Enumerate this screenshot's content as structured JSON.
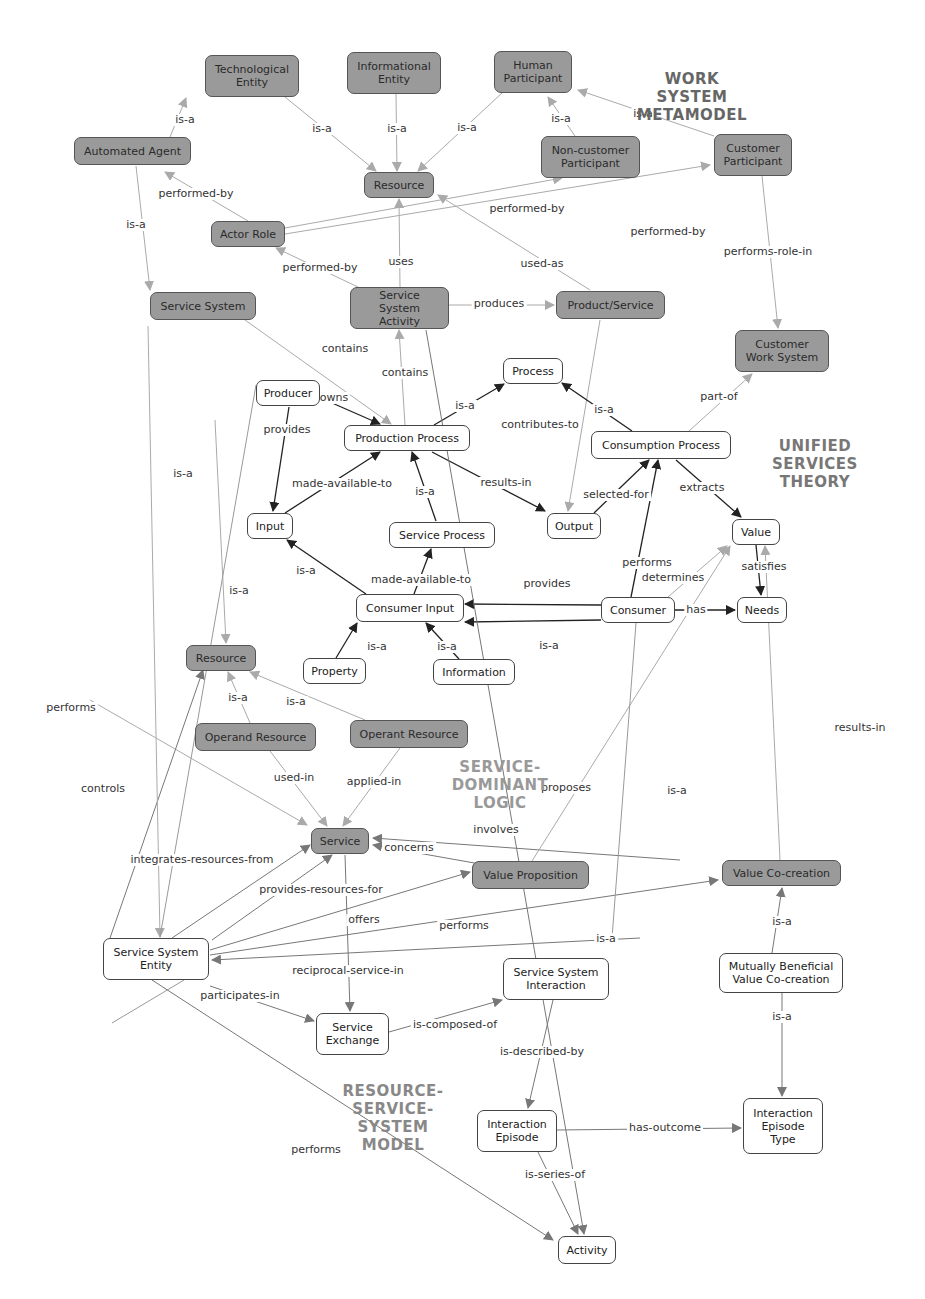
{
  "sections": [
    {
      "id": "wsm",
      "text": "WORK\nSYSTEM\nMETAMODEL",
      "x": 627,
      "y": 70,
      "w": 130,
      "color": "#666666"
    },
    {
      "id": "ust",
      "text": "UNIFIED\nSERVICES\nTHEORY",
      "x": 755,
      "y": 437,
      "w": 120,
      "color": "#777777"
    },
    {
      "id": "sdl",
      "text": "SERVICE-\nDOMINANT\nLOGIC",
      "x": 440,
      "y": 758,
      "w": 120,
      "color": "#999999"
    },
    {
      "id": "rssm",
      "text": "RESOURCE-\nSERVICE-\nSYSTEM\nMODEL",
      "x": 338,
      "y": 1082,
      "w": 110,
      "color": "#888888"
    }
  ],
  "nodes": [
    {
      "id": "tech",
      "label": "Technological\nEntity",
      "x": 205,
      "y": 55,
      "w": 94,
      "h": 42,
      "style": "dark"
    },
    {
      "id": "info_ent",
      "label": "Informational\nEntity",
      "x": 347,
      "y": 52,
      "w": 94,
      "h": 42,
      "style": "dark"
    },
    {
      "id": "human",
      "label": "Human\nParticipant",
      "x": 494,
      "y": 51,
      "w": 78,
      "h": 42,
      "style": "dark"
    },
    {
      "id": "auto",
      "label": "Automated Agent",
      "x": 74,
      "y": 137,
      "w": 117,
      "h": 28,
      "style": "dark"
    },
    {
      "id": "noncust",
      "label": "Non-customer\nParticipant",
      "x": 541,
      "y": 136,
      "w": 99,
      "h": 42,
      "style": "dark"
    },
    {
      "id": "custpart",
      "label": "Customer\nParticipant",
      "x": 714,
      "y": 134,
      "w": 78,
      "h": 42,
      "style": "dark"
    },
    {
      "id": "res_top",
      "label": "Resource",
      "x": 364,
      "y": 172,
      "w": 70,
      "h": 26,
      "style": "dark"
    },
    {
      "id": "actor",
      "label": "Actor Role",
      "x": 211,
      "y": 221,
      "w": 74,
      "h": 26,
      "style": "dark"
    },
    {
      "id": "svcsys",
      "label": "Service System",
      "x": 150,
      "y": 292,
      "w": 106,
      "h": 28,
      "style": "dark"
    },
    {
      "id": "ssa",
      "label": "Service System\nActivity",
      "x": 350,
      "y": 287,
      "w": 99,
      "h": 42,
      "style": "dark"
    },
    {
      "id": "prodsvc",
      "label": "Product/Service",
      "x": 556,
      "y": 291,
      "w": 109,
      "h": 28,
      "style": "dark"
    },
    {
      "id": "custws",
      "label": "Customer\nWork System",
      "x": 735,
      "y": 330,
      "w": 94,
      "h": 42,
      "style": "dark"
    },
    {
      "id": "process",
      "label": "Process",
      "x": 503,
      "y": 358,
      "w": 60,
      "h": 26,
      "style": "light"
    },
    {
      "id": "producer",
      "label": "Producer",
      "x": 256,
      "y": 380,
      "w": 64,
      "h": 26,
      "style": "light"
    },
    {
      "id": "prodproc",
      "label": "Production Process",
      "x": 344,
      "y": 425,
      "w": 126,
      "h": 26,
      "style": "light"
    },
    {
      "id": "consproc",
      "label": "Consumption Process",
      "x": 591,
      "y": 431,
      "w": 140,
      "h": 28,
      "style": "light"
    },
    {
      "id": "input",
      "label": "Input",
      "x": 247,
      "y": 513,
      "w": 46,
      "h": 26,
      "style": "light"
    },
    {
      "id": "svcproc",
      "label": "Service Process",
      "x": 389,
      "y": 522,
      "w": 106,
      "h": 26,
      "style": "light"
    },
    {
      "id": "output",
      "label": "Output",
      "x": 547,
      "y": 513,
      "w": 54,
      "h": 26,
      "style": "light"
    },
    {
      "id": "value",
      "label": "Value",
      "x": 732,
      "y": 519,
      "w": 48,
      "h": 26,
      "style": "light"
    },
    {
      "id": "consinput",
      "label": "Consumer Input",
      "x": 356,
      "y": 594,
      "w": 108,
      "h": 28,
      "style": "light"
    },
    {
      "id": "consumer",
      "label": "Consumer",
      "x": 601,
      "y": 597,
      "w": 74,
      "h": 26,
      "style": "light"
    },
    {
      "id": "needs",
      "label": "Needs",
      "x": 737,
      "y": 597,
      "w": 50,
      "h": 26,
      "style": "light"
    },
    {
      "id": "property",
      "label": "Property",
      "x": 303,
      "y": 658,
      "w": 63,
      "h": 26,
      "style": "light"
    },
    {
      "id": "information",
      "label": "Information",
      "x": 433,
      "y": 659,
      "w": 82,
      "h": 26,
      "style": "light"
    },
    {
      "id": "res_mid",
      "label": "Resource",
      "x": 186,
      "y": 645,
      "w": 70,
      "h": 26,
      "style": "dark"
    },
    {
      "id": "operand",
      "label": "Operand Resource",
      "x": 195,
      "y": 723,
      "w": 121,
      "h": 28,
      "style": "dark"
    },
    {
      "id": "operant",
      "label": "Operant Resource",
      "x": 350,
      "y": 720,
      "w": 118,
      "h": 28,
      "style": "dark"
    },
    {
      "id": "service",
      "label": "Service",
      "x": 311,
      "y": 828,
      "w": 58,
      "h": 26,
      "style": "dark"
    },
    {
      "id": "valprop",
      "label": "Value Proposition",
      "x": 472,
      "y": 861,
      "w": 117,
      "h": 28,
      "style": "dark"
    },
    {
      "id": "valcoc",
      "label": "Value Co-creation",
      "x": 722,
      "y": 860,
      "w": 119,
      "h": 26,
      "style": "dark"
    },
    {
      "id": "sse",
      "label": "Service System\nEntity",
      "x": 103,
      "y": 938,
      "w": 106,
      "h": 42,
      "style": "light"
    },
    {
      "id": "mbvc",
      "label": "Mutually Beneficial\nValue Co-creation",
      "x": 719,
      "y": 953,
      "w": 124,
      "h": 40,
      "style": "light"
    },
    {
      "id": "ssi",
      "label": "Service System\nInteraction",
      "x": 503,
      "y": 958,
      "w": 106,
      "h": 42,
      "style": "light"
    },
    {
      "id": "svcexch",
      "label": "Service\nExchange",
      "x": 316,
      "y": 1013,
      "w": 73,
      "h": 42,
      "style": "light"
    },
    {
      "id": "intep",
      "label": "Interaction\nEpisode",
      "x": 477,
      "y": 1110,
      "w": 80,
      "h": 42,
      "style": "light"
    },
    {
      "id": "intept",
      "label": "Interaction\nEpisode\nType",
      "x": 743,
      "y": 1098,
      "w": 80,
      "h": 56,
      "style": "light"
    },
    {
      "id": "activity",
      "label": "Activity",
      "x": 558,
      "y": 1236,
      "w": 58,
      "h": 28,
      "style": "light"
    }
  ],
  "edges": [
    {
      "from": [
        170,
        137
      ],
      "to": [
        186,
        98
      ],
      "label": "is-a",
      "lx": 185,
      "ly": 120,
      "tone": "light"
    },
    {
      "from": [
        285,
        97
      ],
      "to": [
        376,
        171
      ],
      "label": "is-a",
      "lx": 322,
      "ly": 129,
      "tone": "light"
    },
    {
      "from": [
        396,
        94
      ],
      "to": [
        397,
        171
      ],
      "label": "is-a",
      "lx": 397,
      "ly": 129,
      "tone": "light"
    },
    {
      "from": [
        502,
        93
      ],
      "to": [
        418,
        171
      ],
      "label": "is-a",
      "lx": 467,
      "ly": 128,
      "tone": "light"
    },
    {
      "from": [
        575,
        136
      ],
      "to": [
        548,
        97
      ],
      "label": "is-a",
      "lx": 561,
      "ly": 119,
      "tone": "light"
    },
    {
      "from": [
        714,
        136
      ],
      "to": [
        578,
        90
      ],
      "label": "is-a",
      "lx": 643,
      "ly": 114,
      "tone": "light"
    },
    {
      "from": [
        248,
        221
      ],
      "to": [
        165,
        172
      ],
      "label": "performed-by",
      "lx": 196,
      "ly": 194,
      "tone": "light"
    },
    {
      "from": [
        285,
        228
      ],
      "to": [
        562,
        178
      ],
      "label": "performed-by",
      "lx": 527,
      "ly": 209,
      "tone": "light"
    },
    {
      "from": [
        285,
        234
      ],
      "to": [
        710,
        165
      ],
      "label": "performed-by",
      "lx": 668,
      "ly": 232,
      "tone": "light"
    },
    {
      "from": [
        136,
        166
      ],
      "to": [
        150,
        290
      ],
      "label": "is-a",
      "lx": 136,
      "ly": 225,
      "tone": "light"
    },
    {
      "from": [
        360,
        288
      ],
      "to": [
        276,
        248
      ],
      "label": "performed-by",
      "lx": 320,
      "ly": 268,
      "tone": "light"
    },
    {
      "from": [
        400,
        287
      ],
      "to": [
        399,
        199
      ],
      "label": "uses",
      "lx": 401,
      "ly": 262,
      "tone": "light"
    },
    {
      "from": [
        590,
        290
      ],
      "to": [
        438,
        195
      ],
      "label": "used-as",
      "lx": 542,
      "ly": 264,
      "tone": "light"
    },
    {
      "from": [
        449,
        305
      ],
      "to": [
        554,
        305
      ],
      "label": "produces",
      "lx": 499,
      "ly": 304,
      "tone": "light"
    },
    {
      "from": [
        762,
        176
      ],
      "to": [
        778,
        328
      ],
      "label": "performs-role-in",
      "lx": 768,
      "ly": 252,
      "tone": "light"
    },
    {
      "from": [
        689,
        431
      ],
      "to": [
        752,
        374
      ],
      "label": "part-of",
      "lx": 719,
      "ly": 397,
      "tone": "light"
    },
    {
      "from": [
        245,
        320
      ],
      "to": [
        391,
        424
      ],
      "label": "contains",
      "lx": 345,
      "ly": 349,
      "tone": "light"
    },
    {
      "from": [
        405,
        425
      ],
      "to": [
        399,
        330
      ],
      "label": "contains",
      "lx": 405,
      "ly": 373,
      "tone": "light"
    },
    {
      "from": [
        600,
        320
      ],
      "to": [
        568,
        511
      ],
      "label": "contributes-to",
      "lx": 540,
      "ly": 425,
      "tone": "light"
    },
    {
      "from": [
        323,
        399
      ],
      "to": [
        380,
        424
      ],
      "label": "owns",
      "lx": 334,
      "ly": 398,
      "tone": "dark"
    },
    {
      "from": [
        434,
        425
      ],
      "to": [
        504,
        384
      ],
      "label": "is-a",
      "lx": 465,
      "ly": 406,
      "tone": "dark"
    },
    {
      "from": [
        632,
        431
      ],
      "to": [
        562,
        383
      ],
      "label": "is-a",
      "lx": 604,
      "ly": 410,
      "tone": "dark"
    },
    {
      "from": [
        289,
        407
      ],
      "to": [
        273,
        511
      ],
      "label": "provides",
      "lx": 287,
      "ly": 430,
      "tone": "dark"
    },
    {
      "from": [
        285,
        513
      ],
      "to": [
        380,
        452
      ],
      "label": "made-available-to",
      "lx": 342,
      "ly": 484,
      "tone": "dark"
    },
    {
      "from": [
        436,
        521
      ],
      "to": [
        412,
        452
      ],
      "label": "is-a",
      "lx": 425,
      "ly": 492,
      "tone": "dark"
    },
    {
      "from": [
        432,
        452
      ],
      "to": [
        545,
        511
      ],
      "label": "results-in",
      "lx": 506,
      "ly": 483,
      "tone": "dark"
    },
    {
      "from": [
        594,
        513
      ],
      "to": [
        649,
        460
      ],
      "label": "selected-for",
      "lx": 616,
      "ly": 495,
      "tone": "dark"
    },
    {
      "from": [
        676,
        460
      ],
      "to": [
        741,
        517
      ],
      "label": "extracts",
      "lx": 702,
      "ly": 488,
      "tone": "dark"
    },
    {
      "from": [
        366,
        594
      ],
      "to": [
        287,
        540
      ],
      "label": "is-a",
      "lx": 306,
      "ly": 571,
      "tone": "dark"
    },
    {
      "from": [
        414,
        594
      ],
      "to": [
        431,
        549
      ],
      "label": "made-available-to",
      "lx": 421,
      "ly": 580,
      "tone": "dark"
    },
    {
      "from": [
        601,
        605
      ],
      "to": [
        465,
        604
      ],
      "label": "provides",
      "lx": 547,
      "ly": 584,
      "tone": "dark"
    },
    {
      "from": [
        601,
        620
      ],
      "to": [
        465,
        622
      ],
      "label": "is-a",
      "lx": 549,
      "ly": 646,
      "tone": "dark"
    },
    {
      "from": [
        631,
        597
      ],
      "to": [
        658,
        460
      ],
      "label": "performs",
      "lx": 647,
      "ly": 563,
      "tone": "dark"
    },
    {
      "from": [
        675,
        610
      ],
      "to": [
        735,
        610
      ],
      "label": "has",
      "lx": 696,
      "ly": 610,
      "tone": "dark"
    },
    {
      "from": [
        756,
        545
      ],
      "to": [
        761,
        595
      ],
      "label": "satisfies",
      "lx": 764,
      "ly": 567,
      "tone": "dark"
    },
    {
      "from": [
        668,
        597
      ],
      "to": [
        727,
        546
      ],
      "label": "determines",
      "lx": 673,
      "ly": 578,
      "tone": "light"
    },
    {
      "from": [
        336,
        658
      ],
      "to": [
        357,
        623
      ],
      "label": "is-a",
      "lx": 377,
      "ly": 647,
      "tone": "dark"
    },
    {
      "from": [
        459,
        659
      ],
      "to": [
        426,
        623
      ],
      "label": "is-a",
      "lx": 447,
      "ly": 647,
      "tone": "dark"
    },
    {
      "from": [
        215,
        420
      ],
      "to": [
        226,
        643
      ],
      "label": "is-a",
      "lx": 239,
      "ly": 591,
      "tone": "light"
    },
    {
      "from": [
        250,
        723
      ],
      "to": [
        228,
        672
      ],
      "label": "is-a",
      "lx": 238,
      "ly": 698,
      "tone": "light"
    },
    {
      "from": [
        365,
        720
      ],
      "to": [
        250,
        672
      ],
      "label": "is-a",
      "lx": 296,
      "ly": 702,
      "tone": "light"
    },
    {
      "from": [
        270,
        751
      ],
      "to": [
        327,
        826
      ],
      "label": "used-in",
      "lx": 294,
      "ly": 778,
      "tone": "light"
    },
    {
      "from": [
        400,
        748
      ],
      "to": [
        343,
        826
      ],
      "label": "applied-in",
      "lx": 374,
      "ly": 782,
      "tone": "light"
    },
    {
      "from": [
        90,
        700
      ],
      "to": [
        307,
        825
      ],
      "label": "performs",
      "lx": 71,
      "ly": 708,
      "tone": "light"
    },
    {
      "from": [
        110,
        938
      ],
      "to": [
        203,
        670
      ],
      "label": "controls",
      "lx": 103,
      "ly": 789,
      "tone": "mid"
    },
    {
      "from": [
        172,
        938
      ],
      "to": [
        310,
        845
      ],
      "label": "integrates-resources-from",
      "lx": 202,
      "ly": 860,
      "tone": "mid"
    },
    {
      "from": [
        212,
        940
      ],
      "to": [
        332,
        855
      ],
      "label": "provides-resources-for",
      "lx": 321,
      "ly": 890,
      "tone": "mid"
    },
    {
      "from": [
        680,
        860
      ],
      "to": [
        373,
        838
      ],
      "label": "involves",
      "lx": 496,
      "ly": 830,
      "tone": "mid"
    },
    {
      "from": [
        480,
        864
      ],
      "to": [
        373,
        845
      ],
      "label": "concerns",
      "lx": 409,
      "ly": 848,
      "tone": "mid"
    },
    {
      "from": [
        210,
        950
      ],
      "to": [
        470,
        872
      ],
      "label": "offers",
      "lx": 364,
      "ly": 920,
      "tone": "mid"
    },
    {
      "from": [
        210,
        955
      ],
      "to": [
        718,
        880
      ],
      "label": "performs",
      "lx": 464,
      "ly": 926,
      "tone": "mid"
    },
    {
      "from": [
        640,
        938
      ],
      "to": [
        212,
        960
      ],
      "label": "is-a",
      "lx": 606,
      "ly": 939,
      "tone": "mid"
    },
    {
      "from": [
        532,
        861
      ],
      "to": [
        730,
        546
      ],
      "label": "proposes",
      "lx": 566,
      "ly": 788,
      "tone": "light"
    },
    {
      "from": [
        780,
        860
      ],
      "to": [
        765,
        546
      ],
      "label": "results-in",
      "lx": 860,
      "ly": 728,
      "tone": "light"
    },
    {
      "from": [
        772,
        953
      ],
      "to": [
        782,
        888
      ],
      "label": "is-a",
      "lx": 782,
      "ly": 922,
      "tone": "mid"
    },
    {
      "from": [
        782,
        993
      ],
      "to": [
        782,
        1096
      ],
      "label": "is-a",
      "lx": 782,
      "ly": 1017,
      "tone": "mid"
    },
    {
      "from": [
        184,
        980
      ],
      "to": [
        112,
        1023
      ],
      "label": "",
      "lx": 0,
      "ly": 0,
      "tone": "none"
    },
    {
      "from": [
        148,
        326
      ],
      "to": [
        160,
        937
      ],
      "label": "is-a",
      "lx": 183,
      "ly": 474,
      "tone": "light"
    },
    {
      "from": [
        256,
        385
      ],
      "to": [
        160,
        937
      ],
      "label": "",
      "lx": 0,
      "ly": 0,
      "tone": "none"
    },
    {
      "from": [
        345,
        855
      ],
      "to": [
        350,
        1011
      ],
      "label": "reciprocal-service-in",
      "lx": 348,
      "ly": 971,
      "tone": "mid"
    },
    {
      "from": [
        210,
        986
      ],
      "to": [
        314,
        1021
      ],
      "label": "participates-in",
      "lx": 240,
      "ly": 996,
      "tone": "mid"
    },
    {
      "from": [
        389,
        1032
      ],
      "to": [
        502,
        1000
      ],
      "label": "is-composed-of",
      "lx": 455,
      "ly": 1025,
      "tone": "mid"
    },
    {
      "from": [
        553,
        1000
      ],
      "to": [
        528,
        1108
      ],
      "label": "is-described-by",
      "lx": 542,
      "ly": 1052,
      "tone": "mid"
    },
    {
      "from": [
        557,
        1130
      ],
      "to": [
        741,
        1128
      ],
      "label": "has-outcome",
      "lx": 665,
      "ly": 1128,
      "tone": "mid"
    },
    {
      "from": [
        538,
        1152
      ],
      "to": [
        578,
        1234
      ],
      "label": "is-series-of",
      "lx": 555,
      "ly": 1175,
      "tone": "mid"
    },
    {
      "from": [
        152,
        980
      ],
      "to": [
        553,
        1240
      ],
      "label": "performs",
      "lx": 316,
      "ly": 1150,
      "tone": "mid"
    },
    {
      "from": [
        426,
        330
      ],
      "to": [
        584,
        1234
      ],
      "label": "is-a",
      "lx": 677,
      "ly": 791,
      "tone": "mid"
    },
    {
      "from": [
        636,
        623
      ],
      "to": [
        612,
        938
      ],
      "label": "",
      "lx": 0,
      "ly": 0,
      "tone": "none"
    }
  ]
}
